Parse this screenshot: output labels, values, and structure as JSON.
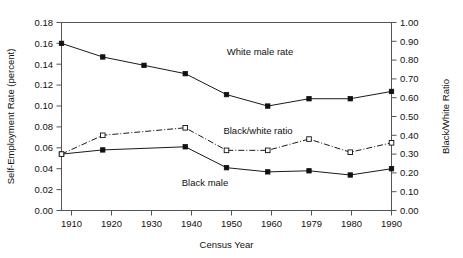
{
  "chart_data": {
    "type": "line",
    "title": "",
    "xlabel": "Census Year",
    "ylabel": "Self-Employment Rate (percent)",
    "y2label": "Black/White Ratio",
    "categories": [
      "1910",
      "1920",
      "1930",
      "1940",
      "1950",
      "1960",
      "1979",
      "1980",
      "1990"
    ],
    "x_tick_labels": [
      "1910",
      "1920",
      "1930",
      "1940",
      "1950",
      "1960",
      "1979",
      "1980",
      "1990"
    ],
    "y_tick_labels": [
      "0.00",
      "0.02",
      "0.04",
      "0.06",
      "0.08",
      "0.10",
      "0.12",
      "0.14",
      "0.16",
      "0.18"
    ],
    "y2_tick_labels": [
      "0.00",
      "0.10",
      "0.20",
      "0.30",
      "0.40",
      "0.50",
      "0.60",
      "0.70",
      "0.80",
      "0.90",
      "1.00"
    ],
    "ylim": [
      0.0,
      0.18
    ],
    "y2lim": [
      0.0,
      1.0
    ],
    "grid": false,
    "legend_position": "inline-annotations",
    "series": [
      {
        "name": "White male rate",
        "axis": "left",
        "marker": "filled-square",
        "linestyle": "solid",
        "color": "#111111",
        "x": [
          "1910",
          "1920",
          "1930",
          "1940",
          "1950",
          "1960",
          "1979",
          "1980",
          "1990"
        ],
        "values": [
          0.16,
          0.147,
          0.139,
          0.131,
          0.111,
          0.1,
          0.107,
          0.107,
          0.114
        ]
      },
      {
        "name": "Black male",
        "axis": "left",
        "marker": "filled-square",
        "linestyle": "solid",
        "color": "#111111",
        "x": [
          "1910",
          "1920",
          "1940",
          "1950",
          "1960",
          "1979",
          "1980",
          "1990"
        ],
        "values": [
          0.054,
          0.058,
          0.061,
          0.041,
          0.037,
          0.038,
          0.034,
          0.04
        ]
      },
      {
        "name": "Black/white ratio",
        "axis": "right",
        "marker": "open-square",
        "linestyle": "dash-dot",
        "color": "#111111",
        "x": [
          "1910",
          "1920",
          "1940",
          "1950",
          "1960",
          "1979",
          "1980",
          "1990"
        ],
        "values": [
          0.3,
          0.4,
          0.44,
          0.32,
          0.32,
          0.38,
          0.31,
          0.36
        ]
      }
    ],
    "annotations": [
      {
        "text": "White male rate",
        "x": 260,
        "y": 55
      },
      {
        "text": "Black/white ratio",
        "x": 258,
        "y": 134
      },
      {
        "text": "Black male",
        "x": 205,
        "y": 186
      }
    ]
  }
}
